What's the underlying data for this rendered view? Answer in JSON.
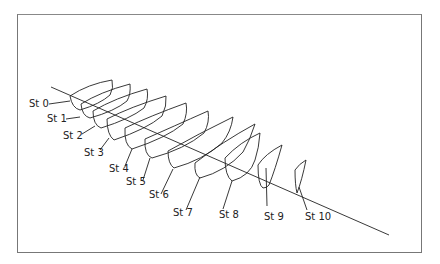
{
  "diagram": {
    "type": "hull-station-sections",
    "line_color": "#222222",
    "frame_color": "#777777",
    "stations": [
      {
        "label": "St 0",
        "x": 29,
        "y": 103
      },
      {
        "label": "St 1",
        "x": 47,
        "y": 114
      },
      {
        "label": "St 2",
        "x": 63,
        "y": 129
      },
      {
        "label": "St 3",
        "x": 84,
        "y": 146
      },
      {
        "label": "St 4",
        "x": 109,
        "y": 163
      },
      {
        "label": "St 5",
        "x": 127,
        "y": 178
      },
      {
        "label": "St 6",
        "x": 149,
        "y": 191
      },
      {
        "label": "St 7",
        "x": 173,
        "y": 207
      },
      {
        "label": "St 8",
        "x": 219,
        "y": 209
      },
      {
        "label": "St 9",
        "x": 264,
        "y": 211
      },
      {
        "label": "St 10",
        "x": 305,
        "y": 211
      }
    ]
  }
}
